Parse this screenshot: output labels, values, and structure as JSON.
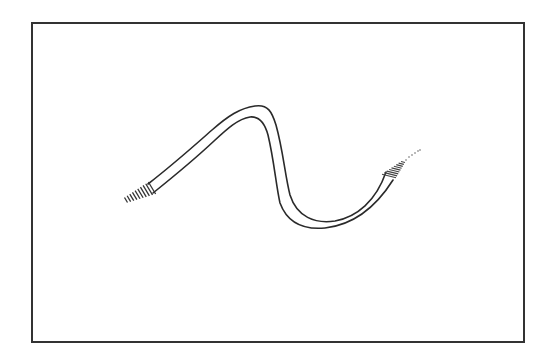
{
  "figure": {
    "colors": {
      "background": "#ffffff",
      "frame": "#333333",
      "line": "#2a2a2a",
      "hatch": "#333333"
    },
    "parts": [
      {
        "name": "frame",
        "label": ""
      },
      {
        "name": "tube-body",
        "label": ""
      },
      {
        "name": "left-end-fitting",
        "label": ""
      },
      {
        "name": "right-end-fitting",
        "label": ""
      }
    ]
  }
}
